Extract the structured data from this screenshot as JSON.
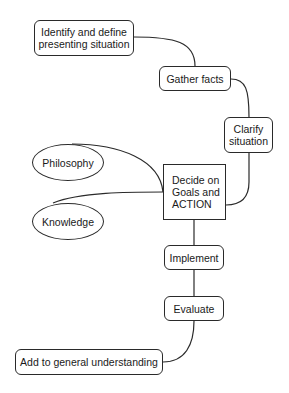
{
  "diagram": {
    "type": "flowchart",
    "nodes": [
      {
        "id": "identify",
        "label": "Identify and define presenting situation",
        "line1": "Identify and define",
        "line2": "presenting situation",
        "shape": "rounded-rect"
      },
      {
        "id": "gather",
        "label": "Gather facts",
        "shape": "rounded-rect"
      },
      {
        "id": "clarify",
        "label": "Clarify situation",
        "line1": "Clarify",
        "line2": "situation",
        "shape": "rounded-rect"
      },
      {
        "id": "decide",
        "label": "Decide on Goals and ACTION",
        "line1": "Decide on",
        "line2": "Goals and",
        "line3": "ACTION",
        "shape": "rect"
      },
      {
        "id": "philosophy",
        "label": "Philosophy",
        "shape": "ellipse"
      },
      {
        "id": "knowledge",
        "label": "Knowledge",
        "shape": "ellipse"
      },
      {
        "id": "implement",
        "label": "Implement",
        "shape": "rounded-rect"
      },
      {
        "id": "evaluate",
        "label": "Evaluate",
        "shape": "rounded-rect"
      },
      {
        "id": "add",
        "label": "Add to general understanding",
        "shape": "rounded-rect"
      }
    ],
    "edges": [
      {
        "from": "identify",
        "to": "gather"
      },
      {
        "from": "gather",
        "to": "clarify"
      },
      {
        "from": "clarify",
        "to": "decide"
      },
      {
        "from": "philosophy",
        "to": "decide"
      },
      {
        "from": "knowledge",
        "to": "decide"
      },
      {
        "from": "decide",
        "to": "implement"
      },
      {
        "from": "implement",
        "to": "evaluate"
      },
      {
        "from": "evaluate",
        "to": "add"
      }
    ]
  }
}
